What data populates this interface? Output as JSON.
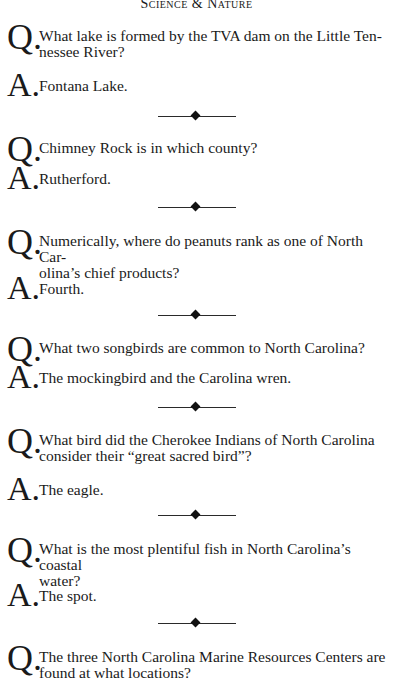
{
  "header": {
    "title": "Science & Nature"
  },
  "items": [
    {
      "q_label": "Q.",
      "question": "What lake is formed by the TVA dam on the Little Ten-­nessee River?",
      "q_lines": [
        "What lake is formed by the TVA dam on the Little Ten-",
        "nessee River?"
      ],
      "a_label": "A.",
      "answer": "Fontana Lake."
    },
    {
      "q_label": "Q.",
      "q_lines": [
        "Chimney Rock is in which county?"
      ],
      "a_label": "A.",
      "answer": "Rutherford."
    },
    {
      "q_label": "Q.",
      "q_lines": [
        "Numerically, where do peanuts rank as one of North Car-",
        "olina’s chief products?"
      ],
      "a_label": "A.",
      "answer": "Fourth."
    },
    {
      "q_label": "Q.",
      "q_lines": [
        "What two songbirds are common to North Carolina?"
      ],
      "a_label": "A.",
      "answer": "The mockingbird and the Carolina wren."
    },
    {
      "q_label": "Q.",
      "q_lines": [
        "What bird did the Cherokee Indians of North Carolina",
        "consider their “great sacred bird”?"
      ],
      "a_label": "A.",
      "answer": "The eagle."
    },
    {
      "q_label": "Q.",
      "q_lines": [
        "What is the most plentiful fish in North Carolina’s coastal",
        "water?"
      ],
      "a_label": "A.",
      "answer": "The spot."
    },
    {
      "q_label": "Q.",
      "q_lines": [
        "The three North Carolina Marine Resources Centers are",
        "found at what locations?"
      ]
    }
  ],
  "divider_icon": "diamond-rule-icon"
}
